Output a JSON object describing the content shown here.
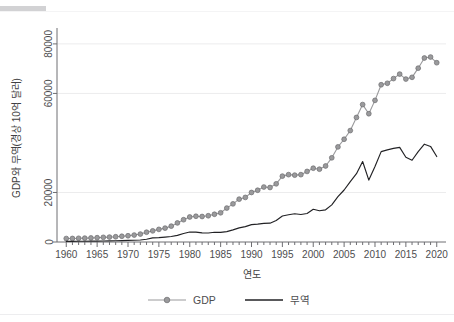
{
  "figure": {
    "accent_bar_color": "#d2d2d4",
    "background_color": "#ffffff"
  },
  "chart_data": {
    "type": "line",
    "title": "",
    "subtitle": "",
    "xlabel": "연도",
    "ylabel": "GDP와 무역(경상 10억 달러)",
    "xlim": [
      1958.5,
      2021.5
    ],
    "ylim": [
      0,
      84000
    ],
    "xticks": [
      1960,
      1965,
      1970,
      1975,
      1980,
      1985,
      1990,
      1995,
      2000,
      2005,
      2010,
      2015,
      2020
    ],
    "xtick_labels": [
      "1960",
      "1965",
      "1970",
      "1975",
      "1980",
      "1985",
      "1990",
      "1995",
      "2000",
      "2005",
      "2010",
      "2015",
      "2020"
    ],
    "yticks": [
      0,
      20000,
      60000,
      80000
    ],
    "ytick_labels": [
      "0",
      "20000",
      "60000",
      "80000"
    ],
    "gridlines": [
      20000,
      60000,
      80000
    ],
    "grid": true,
    "legend_position": "bottom-center",
    "x": [
      1960,
      1961,
      1962,
      1963,
      1964,
      1965,
      1966,
      1967,
      1968,
      1969,
      1970,
      1971,
      1972,
      1973,
      1974,
      1975,
      1976,
      1977,
      1978,
      1979,
      1980,
      1981,
      1982,
      1983,
      1984,
      1985,
      1986,
      1987,
      1988,
      1989,
      1990,
      1991,
      1992,
      1993,
      1994,
      1995,
      1996,
      1997,
      1998,
      1999,
      2000,
      2001,
      2002,
      2003,
      2004,
      2005,
      2006,
      2007,
      2008,
      2009,
      2010,
      2011,
      2012,
      2013,
      2014,
      2015,
      2016,
      2017,
      2018,
      2019,
      2020
    ],
    "series": [
      {
        "name": "GDP",
        "color": "#9a9a9c",
        "marker": "circle",
        "values": [
          1400,
          1430,
          1500,
          1560,
          1640,
          1740,
          1880,
          1980,
          2120,
          2320,
          2520,
          2800,
          3200,
          3950,
          4500,
          5100,
          5600,
          6400,
          7700,
          9000,
          10100,
          10400,
          10300,
          10600,
          11200,
          11800,
          13700,
          15400,
          17300,
          18000,
          20000,
          20900,
          22200,
          22000,
          23500,
          26600,
          27200,
          27000,
          27200,
          28500,
          29800,
          29400,
          30700,
          34000,
          38400,
          41500,
          45000,
          50300,
          55500,
          51800,
          57200,
          63500,
          64100,
          66000,
          67800,
          65800,
          66500,
          70200,
          74300,
          74700,
          72400
        ]
      },
      {
        "name": "무역",
        "color": "#222225",
        "marker": "none",
        "values": [
          260,
          270,
          290,
          310,
          350,
          380,
          420,
          440,
          490,
          560,
          630,
          690,
          810,
          1130,
          1680,
          1780,
          1990,
          2230,
          2680,
          3450,
          4050,
          4010,
          3690,
          3650,
          3940,
          3900,
          4200,
          4900,
          5700,
          6200,
          7000,
          7200,
          7500,
          7600,
          8700,
          10500,
          11000,
          11400,
          11100,
          11500,
          13200,
          12600,
          13000,
          15000,
          18300,
          21000,
          24400,
          27600,
          32500,
          25000,
          30500,
          36500,
          37200,
          37800,
          38200,
          34200,
          33000,
          36500,
          39500,
          38600,
          34500
        ]
      }
    ]
  },
  "legend": {
    "items": [
      {
        "label": "GDP",
        "color": "#9a9a9c",
        "style": "line-marker"
      },
      {
        "label": "무역",
        "color": "#222225",
        "style": "line"
      }
    ]
  }
}
